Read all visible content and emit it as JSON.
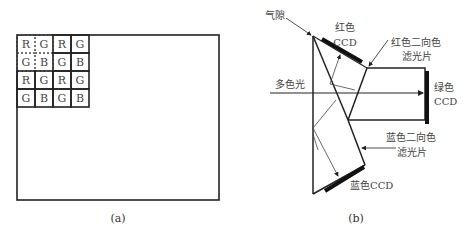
{
  "panel_a": {
    "caption": "(a)",
    "bayer_grid": [
      [
        "R",
        "G",
        "R",
        "G"
      ],
      [
        "G",
        "B",
        "G",
        "B"
      ],
      [
        "R",
        "G",
        "R",
        "G"
      ],
      [
        "G",
        "B",
        "G",
        "B"
      ]
    ]
  },
  "panel_b": {
    "caption": "(b)",
    "labels": {
      "air_gap": "气隙",
      "red_ccd_line1": "红色",
      "red_ccd_line2": "CCD",
      "red_filter_line1": "红色二向色",
      "red_filter_line2": "滤光片",
      "polychromatic_light": "多色光",
      "green_ccd_line1": "绿色",
      "green_ccd_line2": "CCD",
      "blue_filter_line1": "蓝色二向色",
      "blue_filter_line2": "滤光片",
      "blue_ccd": "蓝色CCD"
    }
  }
}
